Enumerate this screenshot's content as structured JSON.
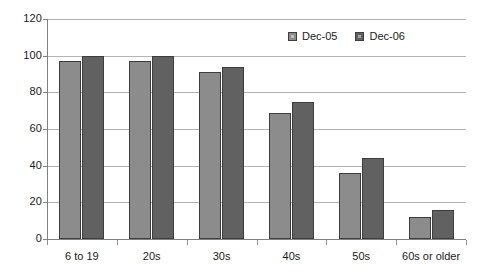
{
  "chart_data": {
    "type": "bar",
    "title": "",
    "subtitle": "",
    "xlabel": "",
    "ylabel": "",
    "categories": [
      "6 to 19",
      "20s",
      "30s",
      "40s",
      "50s",
      "60s or older"
    ],
    "series": [
      {
        "name": "Dec-05",
        "color": "#8c8c8c",
        "values": [
          97,
          97,
          91,
          69,
          36,
          12
        ]
      },
      {
        "name": "Dec-06",
        "color": "#616161",
        "values": [
          100,
          100,
          94,
          75,
          44,
          16
        ]
      }
    ],
    "ylim": [
      0,
      120
    ],
    "ytick_step": 20,
    "yticks": [
      "0",
      "20",
      "40",
      "60",
      "80",
      "100",
      "120"
    ],
    "grid": true,
    "grid_axis": "y",
    "legend_position": "top-right",
    "legend_entries": [
      "Dec-05",
      "Dec-06"
    ]
  },
  "axes": {
    "y_tick_labels": [
      "120",
      "100",
      "80",
      "60",
      "40",
      "20",
      "0"
    ],
    "x_tick_labels": [
      "6 to 19",
      "20s",
      "30s",
      "40s",
      "50s",
      "60s or older"
    ]
  }
}
